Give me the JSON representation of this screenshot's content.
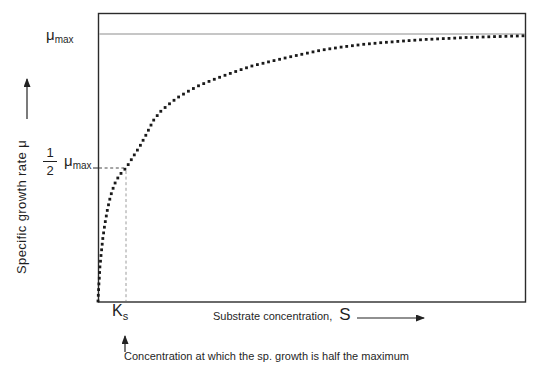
{
  "labels": {
    "mu_max_top": {
      "base": "μ",
      "sub": "max"
    },
    "half": {
      "numerator": "1",
      "denominator": "2",
      "base": "μ",
      "sub": "max"
    },
    "y_axis": "Specific growth rate μ",
    "ks": {
      "base": "K",
      "sub": "s"
    },
    "x_axis_text": "Substrate concentration,",
    "x_axis_symbol": "S",
    "annotation": "Concentration at which the sp. growth is half the maximum"
  },
  "colors": {
    "curve": "#1a1a1a",
    "border": "#2b2b2b",
    "mu_line": "#b3b3b3",
    "dash_dark": "#4a4a4a",
    "dash_light": "#9c9c9c",
    "text": "#1f1f1f",
    "background": "#ffffff"
  },
  "chart_data": {
    "type": "line",
    "line_style": "dotted",
    "title": "",
    "xlabel": "Substrate concentration, S",
    "ylabel": "Specific growth rate μ",
    "x_tick_labels": [
      "Ks"
    ],
    "y_reference_labels": [
      "μmax",
      "1/2 μmax"
    ],
    "asymptote_label": "μmax",
    "half_max_point": {
      "x_label": "Ks",
      "y_label": "1/2 μmax"
    },
    "annotation": "Concentration at which the sp. growth is half the maximum",
    "grid": false,
    "legend": false,
    "plot_area_px": {
      "left": 98,
      "top": 13,
      "right": 525,
      "bottom": 302
    },
    "mu_max_line_y_px": 34,
    "half_max_y_px": 168,
    "ks_x_px": 126,
    "dot_size_px": 2.8,
    "dot_spacing_px": 5.7,
    "curve_anchors_px": [
      [
        98,
        301
      ],
      [
        99,
        283
      ],
      [
        100,
        266
      ],
      [
        101.5,
        251
      ],
      [
        103,
        237
      ],
      [
        105,
        223
      ],
      [
        107.5,
        209
      ],
      [
        110.5,
        196
      ],
      [
        114.5,
        184
      ],
      [
        119.5,
        175
      ],
      [
        126,
        168
      ],
      [
        133,
        157
      ],
      [
        140,
        146
      ],
      [
        147,
        133
      ],
      [
        153,
        121
      ],
      [
        160,
        112
      ],
      [
        168,
        105
      ],
      [
        177,
        98
      ],
      [
        187,
        92
      ],
      [
        198,
        86
      ],
      [
        210,
        81
      ],
      [
        223,
        76
      ],
      [
        237,
        71
      ],
      [
        252,
        66
      ],
      [
        268,
        62
      ],
      [
        285,
        58
      ],
      [
        303,
        54
      ],
      [
        322,
        50
      ],
      [
        342,
        47
      ],
      [
        362,
        44.5
      ],
      [
        383,
        42.5
      ],
      [
        404,
        41
      ],
      [
        425,
        39.5
      ],
      [
        446,
        38.5
      ],
      [
        467,
        37.5
      ],
      [
        488,
        36.8
      ],
      [
        509,
        36.2
      ],
      [
        525,
        35.8
      ]
    ]
  }
}
